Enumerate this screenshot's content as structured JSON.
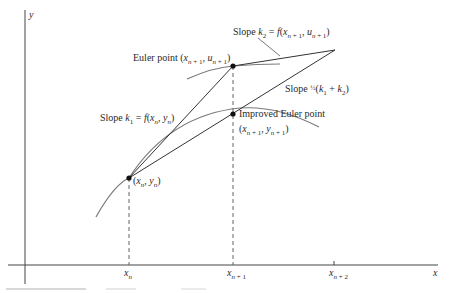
{
  "diagram": {
    "axes": {
      "x_label": "x",
      "y_label": "y",
      "x_ticks": [
        "x_n",
        "x_{n+1}",
        "x_{n+2}"
      ]
    },
    "labels": {
      "euler_point": "Euler point (x_{n+1}, u_{n+1})",
      "slope_k1": "Slope k_1 = f(x_n, y_n)",
      "slope_k2": "Slope k_2 = f(x_{n+1}, u_{n+1})",
      "slope_avg": "Slope ½(k_1 + k_2)",
      "improved_euler_point": "Improved Euler point",
      "improved_euler_coords": "(x_{n+1}, y_{n+1})",
      "start_point": "(x_n, y_n)"
    },
    "points": [
      {
        "name": "start",
        "label": "(x_n, y_n)",
        "px": [
          129,
          178
        ]
      },
      {
        "name": "euler",
        "label": "(x_{n+1}, u_{n+1})",
        "px": [
          233,
          66
        ]
      },
      {
        "name": "improved_euler",
        "label": "(x_{n+1}, y_{n+1})",
        "px": [
          233,
          114
        ]
      }
    ],
    "colors": {
      "ink": "#222222",
      "curve": "#777777",
      "dashed": "#666666"
    }
  }
}
